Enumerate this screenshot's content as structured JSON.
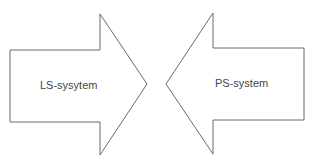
{
  "diagram": {
    "arrows": [
      {
        "label": "LS-sysytem",
        "direction": "right"
      },
      {
        "label": "PS-system",
        "direction": "left"
      }
    ],
    "colors": {
      "stroke": "#6b6b6b",
      "fill": "#ffffff",
      "text": "#444444"
    }
  }
}
